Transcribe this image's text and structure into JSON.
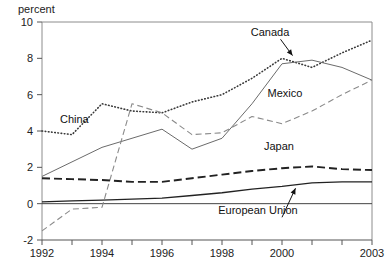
{
  "chart_data": {
    "type": "line",
    "title": "",
    "subtitle": "",
    "xlabel": "",
    "ylabel": "percent",
    "ylabel_position": "top-left",
    "grid": false,
    "legend": "inline-annotations",
    "xlim": [
      1992,
      2003
    ],
    "ylim": [
      -2,
      10
    ],
    "x": [
      1992,
      1993,
      1994,
      1995,
      1996,
      1997,
      1998,
      1999,
      2000,
      2001,
      2002,
      2003
    ],
    "x_ticks": [
      1992,
      1993,
      1994,
      1995,
      1996,
      1997,
      1998,
      1999,
      2000,
      2001,
      2002,
      2003
    ],
    "x_tick_labels": [
      "1992",
      "",
      "1994",
      "",
      "1996",
      "",
      "1998",
      "",
      "2000",
      "",
      "",
      "2003"
    ],
    "y_ticks": [
      -2,
      0,
      2,
      4,
      6,
      8,
      10
    ],
    "y_tick_labels": [
      "-2",
      "0",
      "2",
      "4",
      "6",
      "8",
      "10"
    ],
    "series": [
      {
        "name": "China",
        "style": "dotted",
        "color": "#3a3a3a",
        "values": [
          4.0,
          3.8,
          5.5,
          5.1,
          5.0,
          5.6,
          6.0,
          6.9,
          8.0,
          7.5,
          8.3,
          9.0
        ]
      },
      {
        "name": "Canada",
        "style": "solid-thin",
        "color": "#6b6b6b",
        "values": [
          1.5,
          2.3,
          3.1,
          3.6,
          4.1,
          3.0,
          3.6,
          5.5,
          7.7,
          7.9,
          7.5,
          6.8
        ]
      },
      {
        "name": "Mexico",
        "style": "dashed",
        "color": "#8a8a8a",
        "values": [
          -1.5,
          -0.3,
          -0.2,
          5.5,
          5.0,
          3.8,
          3.9,
          4.8,
          4.4,
          5.1,
          6.0,
          6.8
        ]
      },
      {
        "name": "Japan",
        "style": "long-dashed",
        "color": "#222222",
        "values": [
          1.4,
          1.35,
          1.3,
          1.2,
          1.2,
          1.4,
          1.6,
          1.8,
          1.95,
          2.05,
          1.9,
          1.85
        ]
      },
      {
        "name": "European Union",
        "style": "solid",
        "color": "#222222",
        "values": [
          0.1,
          0.15,
          0.2,
          0.25,
          0.3,
          0.45,
          0.6,
          0.8,
          0.95,
          1.15,
          1.2,
          1.2
        ]
      }
    ],
    "annotations": [
      {
        "text": "China",
        "series": "China",
        "x": 1992.6,
        "y": 4.45,
        "arrow": false
      },
      {
        "text": "Canada",
        "series": "Canada",
        "x": 1999.6,
        "y": 9.25,
        "arrow": true
      },
      {
        "text": "Mexico",
        "series": "Mexico",
        "x": 2000.1,
        "y": 5.85,
        "arrow": false
      },
      {
        "text": "Japan",
        "series": "Japan",
        "x": 1999.9,
        "y": 2.95,
        "arrow": false
      },
      {
        "text": "European Union",
        "series": "European Union",
        "x": 1999.2,
        "y": -0.55,
        "arrow": true
      }
    ]
  }
}
